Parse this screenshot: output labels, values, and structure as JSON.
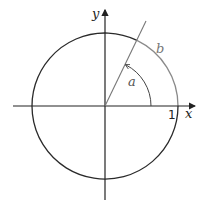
{
  "diagram": {
    "labels": {
      "x_axis": "x",
      "y_axis": "y",
      "angle": "a",
      "arc": "b",
      "unit_tick": "1"
    },
    "colors": {
      "background": "#ffffff",
      "axis": "#222222",
      "circle": "#2a2a2a",
      "ray": "#777777",
      "arc_b": "#8a8a8a",
      "angle_arc": "#444444"
    },
    "geometry": {
      "center": [
        105,
        106
      ],
      "radius": 73,
      "angle_degrees": 64,
      "angle_arc_radius": 46
    }
  }
}
